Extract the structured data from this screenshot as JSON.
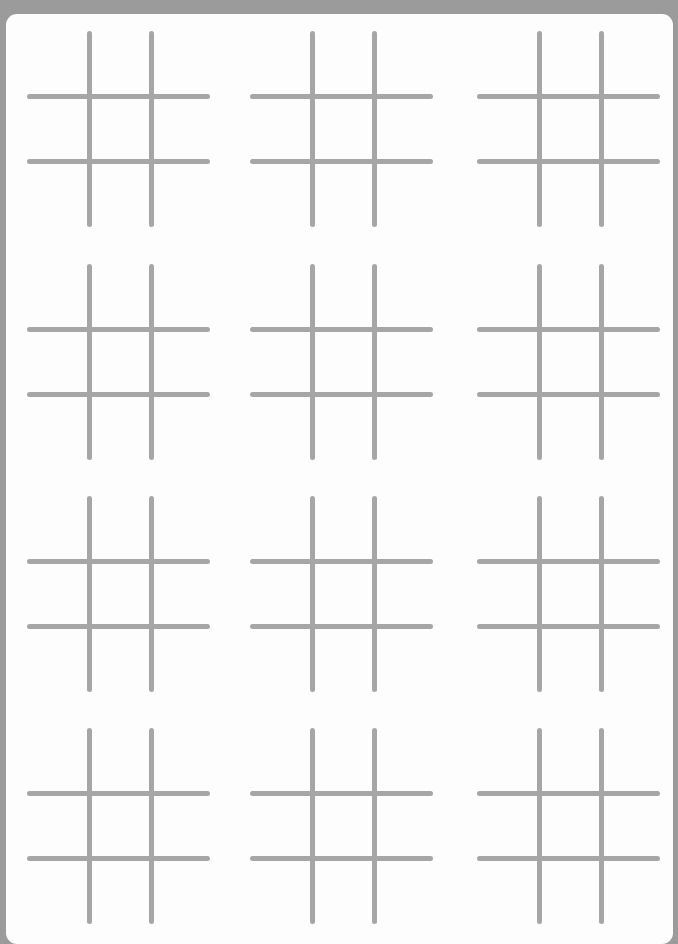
{
  "sheet": {
    "background_color": "#9b9b9b",
    "card_color": "#fdfdfd",
    "line_color": "#a6a6a6",
    "rows": 4,
    "columns": 3,
    "boards": [
      {
        "row": 1,
        "col": 1,
        "left": 21,
        "top": 17
      },
      {
        "row": 1,
        "col": 2,
        "left": 244,
        "top": 17
      },
      {
        "row": 1,
        "col": 3,
        "left": 471,
        "top": 17
      },
      {
        "row": 2,
        "col": 1,
        "left": 21,
        "top": 250
      },
      {
        "row": 2,
        "col": 2,
        "left": 244,
        "top": 250
      },
      {
        "row": 2,
        "col": 3,
        "left": 471,
        "top": 250
      },
      {
        "row": 3,
        "col": 1,
        "left": 21,
        "top": 482
      },
      {
        "row": 3,
        "col": 2,
        "left": 244,
        "top": 482
      },
      {
        "row": 3,
        "col": 3,
        "left": 471,
        "top": 482
      },
      {
        "row": 4,
        "col": 1,
        "left": 21,
        "top": 714
      },
      {
        "row": 4,
        "col": 2,
        "left": 244,
        "top": 714
      },
      {
        "row": 4,
        "col": 3,
        "left": 471,
        "top": 714
      }
    ]
  }
}
